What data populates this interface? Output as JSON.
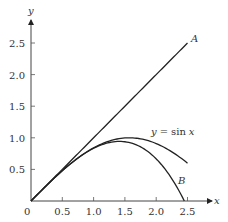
{
  "chart_data": {
    "type": "line",
    "title": "",
    "xlabel": "x",
    "ylabel": "y",
    "xlim": [
      0,
      2.7
    ],
    "ylim": [
      0,
      2.8
    ],
    "grid": false,
    "x_ticks": [
      "0",
      "0.5",
      "1.0",
      "1.5",
      "2.0",
      "2.5"
    ],
    "y_ticks": [
      "0.5",
      "1.0",
      "1.5",
      "2.0",
      "2.5"
    ],
    "series": [
      {
        "name": "A",
        "label": "A",
        "formula": "y = x",
        "x": [
          0,
          0.5,
          1.0,
          1.5,
          2.0,
          2.5
        ],
        "values": [
          0,
          0.5,
          1.0,
          1.5,
          2.0,
          2.5
        ]
      },
      {
        "name": "y = sin x",
        "label": "y = sin x",
        "formula": "y = sin x",
        "x": [
          0,
          0.5,
          1.0,
          1.5,
          2.0,
          2.5
        ],
        "values": [
          0,
          0.479,
          0.841,
          0.997,
          0.909,
          0.598
        ]
      },
      {
        "name": "B",
        "label": "B",
        "formula": "y = x - x^3/6",
        "x": [
          0,
          0.5,
          1.0,
          1.5,
          2.0,
          2.449
        ],
        "values": [
          0,
          0.479,
          0.833,
          0.938,
          0.667,
          0.0
        ]
      }
    ],
    "annotations": [
      {
        "text": "A",
        "x": 2.55,
        "y": 2.55
      },
      {
        "text": "y = sin x",
        "x": 1.7,
        "y": 1.0
      },
      {
        "text": "B",
        "x": 2.35,
        "y": 0.3
      }
    ]
  },
  "labels": {
    "x_axis": "x",
    "y_axis": "y",
    "origin": "0",
    "A": "A",
    "B": "B",
    "sin_y": "y",
    "sin_eq": "=",
    "sin_fn": "sin",
    "sin_x": "x"
  }
}
